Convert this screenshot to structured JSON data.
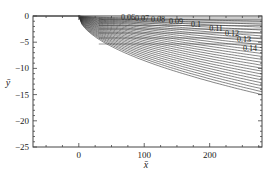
{
  "chart_data": {
    "type": "contour",
    "title": "",
    "xlabel": "x̄",
    "ylabel": "ȳ",
    "xlim": [
      -70,
      280
    ],
    "ylim": [
      -25,
      0
    ],
    "x_ticks": [
      0,
      100,
      200
    ],
    "x_tick_labels": [
      "0",
      "100",
      "200"
    ],
    "y_ticks": [
      0,
      -5,
      -10,
      -15,
      -20,
      -25
    ],
    "y_tick_labels": [
      "0",
      "−5",
      "−10",
      "−15",
      "−20",
      "−25"
    ],
    "grid": false,
    "contour_levels": [
      0.06,
      0.07,
      0.08,
      0.09,
      0.1,
      0.11,
      0.12,
      0.13,
      0.14
    ],
    "contour_labels": [
      "0.06",
      "0.07",
      "0.08",
      "0.09",
      "0.1",
      "0.11",
      "0.12",
      "0.13",
      "0.14"
    ],
    "contour_origin_x": 0,
    "outer_boundary_y_at_right_edge": -15,
    "line_color": "#333333"
  }
}
